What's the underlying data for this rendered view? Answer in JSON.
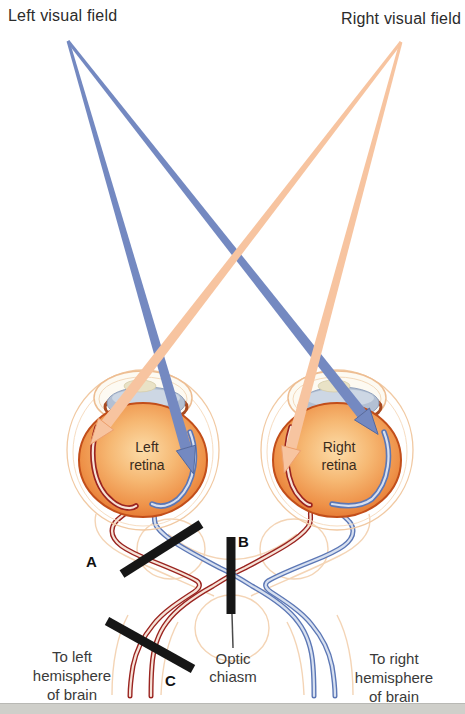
{
  "page": {
    "width": 465,
    "height": 714,
    "background": "#ffffff",
    "bottom_edge_color": "#cfcfca"
  },
  "visual_fields": {
    "left": {
      "label": "Left visual field",
      "ray_color": "#7489c1"
    },
    "right": {
      "label": "Right visual field",
      "ray_color": "#f7c4a0"
    }
  },
  "eyes": {
    "left": {
      "label": "Left\nretina"
    },
    "right": {
      "label": "Right\nretina"
    }
  },
  "chiasm": {
    "label": "Optic\nchiasm"
  },
  "hemispheres": {
    "left": {
      "label": "To left\nhemisphere\nof brain"
    },
    "right": {
      "label": "To right\nhemisphere\nof brain"
    }
  },
  "lesions": {
    "a": {
      "label": "A"
    },
    "b": {
      "label": "B"
    },
    "c": {
      "label": "C"
    },
    "color": "#161616"
  },
  "colors": {
    "ray_blue": "#7489c1",
    "ray_blue_edge": "#53699f",
    "ray_peach": "#f7c4a0",
    "ray_peach_edge": "#eda06f",
    "fiber_red": "#9a2420",
    "fiber_red_core": "#f6e3d8",
    "fiber_blue": "#5c77b5",
    "fiber_blue_core": "#d7e0f0",
    "eye_orange": "#ee9148",
    "eye_rim": "#c24e1a",
    "sheath_faint": "#f3d0ae",
    "lens_blue": "#b3c0d3"
  }
}
